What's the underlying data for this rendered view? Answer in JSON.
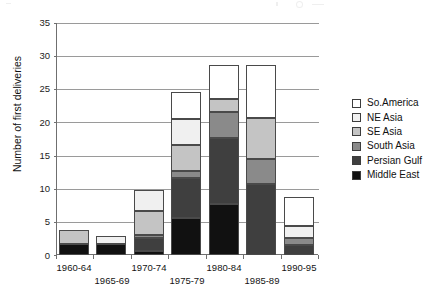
{
  "chart_data": {
    "type": "bar",
    "subtype": "stacked-bar",
    "title": "",
    "xlabel": "",
    "ylabel": "Number of first deliveries",
    "ylim": [
      0,
      35
    ],
    "yticks": [
      0,
      5,
      10,
      15,
      20,
      25,
      30,
      35
    ],
    "grid": true,
    "legend_position": "right",
    "categories": [
      "1960-64",
      "1965-69",
      "1970-74",
      "1975-79",
      "1980-84",
      "1985-89",
      "1990-95"
    ],
    "series": [
      {
        "name": "Middle East",
        "color": "#111111",
        "values": [
          1.7,
          1.7,
          0.6,
          5.6,
          7.7,
          0.0,
          0.0
        ]
      },
      {
        "name": "Persian Gulf",
        "color": "#3f3f3f",
        "values": [
          0.0,
          0.0,
          2.0,
          6.0,
          10.0,
          10.7,
          1.5
        ]
      },
      {
        "name": "South Asia",
        "color": "#8a8a8a",
        "values": [
          0.0,
          0.0,
          0.4,
          1.0,
          3.9,
          3.8,
          1.0
        ]
      },
      {
        "name": "SE Asia",
        "color": "#c4c4c4",
        "values": [
          2.1,
          0.0,
          3.6,
          4.0,
          2.0,
          6.1,
          0.0
        ]
      },
      {
        "name": "NE Asia",
        "color": "#f0f0f0",
        "values": [
          0.0,
          1.1,
          3.2,
          3.9,
          0.0,
          0.0,
          1.9
        ]
      },
      {
        "name": "So.America",
        "color": "#ffffff",
        "values": [
          0.0,
          0.0,
          0.0,
          4.1,
          5.0,
          8.0,
          4.4
        ]
      }
    ],
    "totals": [
      3.8,
      2.8,
      9.8,
      24.6,
      28.6,
      28.6,
      8.8
    ]
  },
  "axis": {
    "y_title": "Number of first deliveries",
    "y_ticks": [
      "35",
      "30",
      "25",
      "20",
      "15",
      "10",
      "5",
      "0"
    ],
    "x_labels": [
      "1960-64",
      "1965-69",
      "1970-74",
      "1975-79",
      "1980-84",
      "1985-89",
      "1990-95"
    ]
  },
  "legend": {
    "items": [
      {
        "label": "So.America",
        "color": "#ffffff"
      },
      {
        "label": "NE Asia",
        "color": "#f0f0f0"
      },
      {
        "label": "SE Asia",
        "color": "#c4c4c4"
      },
      {
        "label": "South Asia",
        "color": "#8a8a8a"
      },
      {
        "label": "Persian Gulf",
        "color": "#3f3f3f"
      },
      {
        "label": "Middle East",
        "color": "#111111"
      }
    ]
  }
}
